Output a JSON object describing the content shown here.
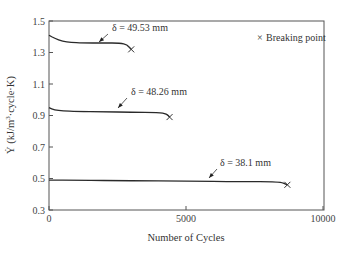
{
  "chart_data": {
    "type": "line",
    "title": "",
    "xlabel": "Number of Cycles",
    "ylabel": "Ẏ (kJ/m³·cycle·K)",
    "xlim": [
      0,
      10000
    ],
    "ylim": [
      0.3,
      1.5
    ],
    "x_ticks": [
      "0",
      "5000",
      "10000"
    ],
    "y_ticks": [
      "0.3",
      "0.5",
      "0.7",
      "0.9",
      "1.1",
      "1.3",
      "1.5"
    ],
    "grid": false,
    "legend": {
      "position": "top-right",
      "entries": [
        "× Breaking point"
      ]
    },
    "series": [
      {
        "name": "δ = 49.53 mm",
        "x": [
          0,
          200,
          500,
          800,
          1200,
          2000,
          2600,
          2850,
          3000
        ],
        "y": [
          1.41,
          1.39,
          1.37,
          1.365,
          1.36,
          1.36,
          1.36,
          1.35,
          1.32
        ],
        "breaking_point": {
          "x": 3000,
          "y": 1.32
        }
      },
      {
        "name": "δ = 48.26 mm",
        "x": [
          0,
          200,
          500,
          1000,
          2000,
          3000,
          4000,
          4300,
          4400
        ],
        "y": [
          0.95,
          0.935,
          0.93,
          0.925,
          0.925,
          0.92,
          0.92,
          0.91,
          0.89
        ],
        "breaking_point": {
          "x": 4400,
          "y": 0.89
        }
      },
      {
        "name": "δ = 38.1 mm",
        "x": [
          0,
          1000,
          3000,
          5000,
          7000,
          8400,
          8700
        ],
        "y": [
          0.49,
          0.49,
          0.485,
          0.485,
          0.48,
          0.48,
          0.46
        ],
        "breaking_point": {
          "x": 8700,
          "y": 0.46
        }
      }
    ],
    "annotations": [
      {
        "text": "δ = 49.53 mm",
        "series": 0
      },
      {
        "text": "δ = 48.26 mm",
        "series": 1
      },
      {
        "text": "δ = 38.1 mm",
        "series": 2
      }
    ]
  },
  "legend": {
    "marker": "×",
    "label": "Breaking point"
  },
  "axes": {
    "xlabel": "Number of Cycles",
    "ylabel_main": "Ẏ (kJ/m",
    "ylabel_sup": "3",
    "ylabel_tail": "·cycle·K)"
  }
}
